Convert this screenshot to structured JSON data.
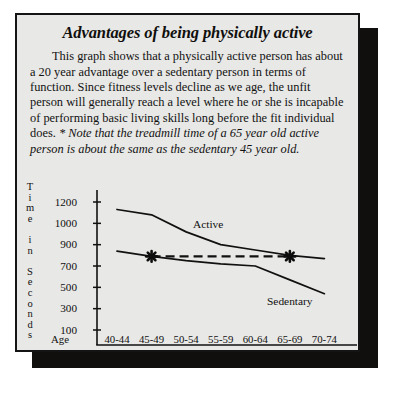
{
  "document": {
    "title": "Advantages of being physically active",
    "paragraph_plain": "This graph shows that a physically active person has about a 20 year advantage over a sedentary person in terms of function. Since fitness levels decline as we age, the unfit person will generally reach a level where he or she is incapable of performing basic living skills long before the fit individual does. ",
    "paragraph_note": "* Note that the treadmill time of a 65 year old active person is about the same as the sedentary 45 year old."
  },
  "chart_data": {
    "type": "line",
    "title": "",
    "xlabel": "Age",
    "ylabel": "Time in Seconds",
    "ylabel_letters": [
      "T",
      "i",
      "m",
      "e",
      " ",
      "i",
      "n",
      " ",
      "S",
      "e",
      "c",
      "o",
      "n",
      "d",
      "s"
    ],
    "categories": [
      "40-44",
      "45-49",
      "50-54",
      "55-59",
      "60-64",
      "65-69",
      "70-74"
    ],
    "ytick_labels": [
      "1200",
      "1000",
      "900",
      "700",
      "500",
      "300",
      "100"
    ],
    "ytick_values": [
      1200,
      1000,
      900,
      700,
      500,
      300,
      100
    ],
    "ylim": [
      0,
      1300
    ],
    "grid": false,
    "legend": "inline-labels",
    "series": [
      {
        "name": "Active",
        "label": "Active",
        "values": [
          1130,
          1080,
          960,
          900,
          850,
          800,
          770
        ],
        "style": "solid"
      },
      {
        "name": "Sedentary",
        "label": "Sedentary",
        "values": [
          840,
          790,
          750,
          720,
          700,
          570,
          440
        ],
        "style": "solid"
      }
    ],
    "annotations": [
      {
        "name": "sedentary-45-49-marker",
        "glyph": "asterisk",
        "category": "45-49",
        "value": 790
      },
      {
        "name": "active-65-69-marker",
        "glyph": "asterisk",
        "category": "65-69",
        "value": 790
      },
      {
        "name": "equivalence-dashed-line",
        "style": "dashed",
        "from_category": "45-49",
        "to_category": "65-69",
        "value": 790
      }
    ]
  },
  "colors": {
    "panel_background": "#e8e8e6",
    "ink": "#111111",
    "border": "#141414",
    "shadow": "#100f0d",
    "page_background": "#ffffff"
  }
}
